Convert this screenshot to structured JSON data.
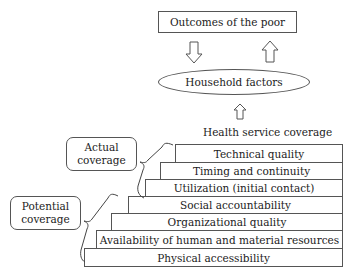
{
  "diagram": {
    "top_box": {
      "label": "Outcomes of the poor"
    },
    "ellipse": {
      "label": "Household factors"
    },
    "coverage_label": "Health service coverage",
    "arrows": [
      {
        "name": "down-arrow-outcomes-to-household",
        "direction": "down"
      },
      {
        "name": "up-arrow-household-to-outcomes",
        "direction": "up"
      },
      {
        "name": "up-arrow-coverage-to-household",
        "direction": "up"
      }
    ],
    "brackets": [
      {
        "label": "Actual coverage",
        "line1": "Actual",
        "line2": "coverage",
        "covers": [
          "Technical quality",
          "Timing and continuity",
          "Utilization (initial contact)"
        ]
      },
      {
        "label": "Potential coverage",
        "line1": "Potential",
        "line2": "coverage",
        "covers": [
          "Social accountability",
          "Organizational quality",
          "Availability of human and material resources",
          "Physical accessibility"
        ]
      }
    ],
    "steps": [
      {
        "label": "Technical quality"
      },
      {
        "label": "Timing and continuity"
      },
      {
        "label": "Utilization (initial contact)"
      },
      {
        "label": "Social accountability"
      },
      {
        "label": "Organizational quality"
      },
      {
        "label": "Availability of human and material resources"
      },
      {
        "label": "Physical accessibility"
      }
    ]
  }
}
